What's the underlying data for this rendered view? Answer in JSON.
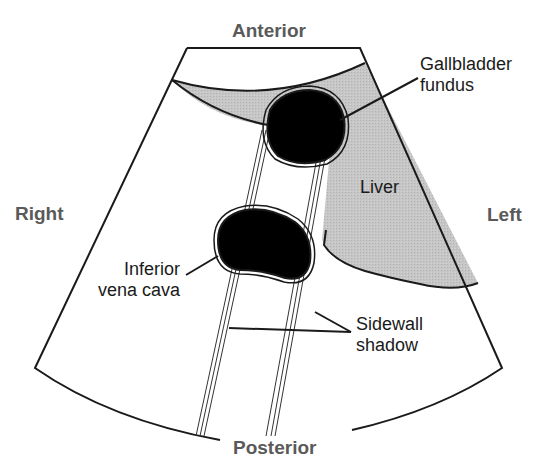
{
  "diagram": {
    "type": "ultrasound-schematic",
    "orientation_labels": {
      "top": "Anterior",
      "bottom": "Posterior",
      "left": "Right",
      "right": "Left"
    },
    "structures": [
      {
        "id": "gallbladder",
        "label_line1": "Gallbladder",
        "label_line2": "fundus"
      },
      {
        "id": "liver",
        "label_line1": "Liver"
      },
      {
        "id": "ivc",
        "label_line1": "Inferior",
        "label_line2": "vena cava"
      },
      {
        "id": "shadow",
        "label_line1": "Sidewall",
        "label_line2": "shadow"
      }
    ],
    "colors": {
      "liver_fill": "#c4c4c4",
      "cyst_fill": "#000000",
      "outline": "#1a1a1a",
      "orientation_text": "#5a5a5a"
    }
  }
}
